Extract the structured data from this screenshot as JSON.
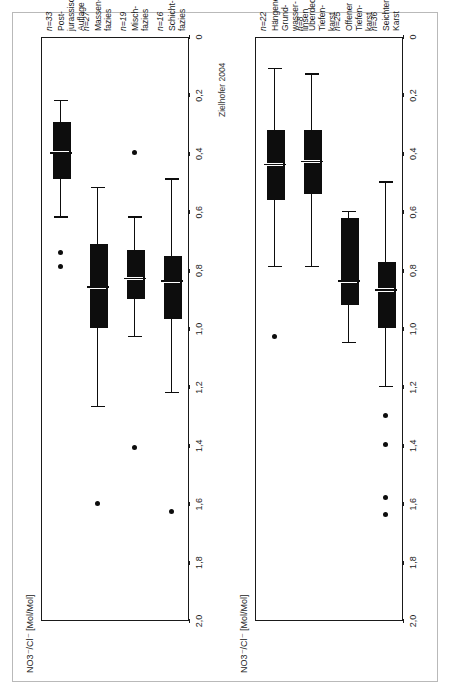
{
  "figure": {
    "credit": "Zielhofer 2004",
    "axis_title": "NO3⁻/Cl⁻ [Mol/Mol]"
  },
  "chart_data": [
    {
      "type": "box",
      "title": "Grundwasserüberdeckung",
      "xlabel": "",
      "ylabel": "NO3⁻/Cl⁻ [Mol/Mol]",
      "ylim": [
        0,
        2.0
      ],
      "yticks": [
        "2,0",
        "1,8",
        "1,6",
        "1,4",
        "1,2",
        "1,0",
        "0,8",
        "0,6",
        "0,4",
        "0,2",
        "0"
      ],
      "ytick_values": [
        2.0,
        1.8,
        1.6,
        1.4,
        1.2,
        1.0,
        0.8,
        0.6,
        0.4,
        0.2,
        0
      ],
      "grid": false,
      "legend": "none",
      "categories": [
        "Schicht-\nfazies",
        "Misch-\nfazies",
        "Massen-\nfazies",
        "Post-\njurassische\nAuflage"
      ],
      "counts": [
        "n=16",
        "n=19",
        "n=27",
        "n=33"
      ],
      "boxes": [
        {
          "category": "Schicht-fazies",
          "n": 16,
          "whisker_low": 0.49,
          "q1": 0.76,
          "median": 0.84,
          "q3": 0.97,
          "whisker_high": 1.22,
          "outliers": [
            1.63
          ]
        },
        {
          "category": "Misch-fazies",
          "n": 19,
          "whisker_low": 0.62,
          "q1": 0.74,
          "median": 0.83,
          "q3": 0.9,
          "whisker_high": 1.03,
          "outliers": [
            0.4,
            1.41
          ]
        },
        {
          "category": "Massen-fazies",
          "n": 27,
          "whisker_low": 0.52,
          "q1": 0.72,
          "median": 0.86,
          "q3": 1.0,
          "whisker_high": 1.27,
          "outliers": [
            1.6
          ]
        },
        {
          "category": "Post-jurassische Auflage",
          "n": 33,
          "whisker_low": 0.22,
          "q1": 0.3,
          "median": 0.4,
          "q3": 0.49,
          "whisker_high": 0.62,
          "outliers": [
            0.74,
            0.79
          ]
        }
      ]
    },
    {
      "type": "box",
      "title": "Quelltyp",
      "xlabel": "",
      "ylabel": "NO3⁻/Cl⁻ [Mol/Mol]",
      "ylim": [
        0,
        2.0
      ],
      "yticks": [
        "2,0",
        "1,8",
        "1,6",
        "1,4",
        "1,2",
        "1,0",
        "0,8",
        "0,6",
        "0,4",
        "0,2",
        "0"
      ],
      "ytick_values": [
        2.0,
        1.8,
        1.6,
        1.4,
        1.2,
        1.0,
        0.8,
        0.6,
        0.4,
        0.2,
        0
      ],
      "grid": false,
      "legend": "none",
      "categories": [
        "Seichter\nKarst",
        "Offener\nTiefen-\nkarst",
        "Überdeckter\nTiefen-\nkarst",
        "Hängende\nGrund-\nwasser-\nlinsen"
      ],
      "counts": [
        "n=36",
        "n=25",
        "n=8",
        "n=22"
      ],
      "boxes": [
        {
          "category": "Seichter Karst",
          "n": 36,
          "whisker_low": 0.5,
          "q1": 0.78,
          "median": 0.87,
          "q3": 1.0,
          "whisker_high": 1.2,
          "outliers": [
            1.3,
            1.4,
            1.58,
            1.64
          ]
        },
        {
          "category": "Offener Tiefen-karst",
          "n": 25,
          "whisker_low": 0.6,
          "q1": 0.63,
          "median": 0.84,
          "q3": 0.92,
          "whisker_high": 1.05,
          "outliers": []
        },
        {
          "category": "Überdeckter Tiefen-karst",
          "n": 8,
          "whisker_low": 0.13,
          "q1": 0.33,
          "median": 0.43,
          "q3": 0.54,
          "whisker_high": 0.79,
          "outliers": []
        },
        {
          "category": "Hängende Grund-wasser-linsen",
          "n": 22,
          "whisker_low": 0.11,
          "q1": 0.33,
          "median": 0.44,
          "q3": 0.56,
          "whisker_high": 0.79,
          "outliers": [
            1.03
          ]
        }
      ]
    }
  ],
  "colors": {
    "ink": "#0d0d0d",
    "frame": "#1a1a1a",
    "sheet_border": "#b9b9b9",
    "background": "#ffffff"
  }
}
